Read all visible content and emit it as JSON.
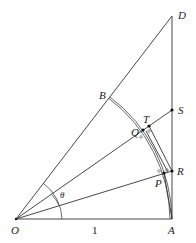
{
  "diagram": {
    "type": "geometry",
    "points": {
      "O": {
        "label": "O",
        "x": 16,
        "y": 219
      },
      "A": {
        "label": "A",
        "x": 172,
        "y": 219
      },
      "D": {
        "label": "D",
        "x": 172,
        "y": 16
      },
      "B": {
        "label": "B",
        "x": 110,
        "y": 97
      },
      "S": {
        "label": "S",
        "x": 172,
        "y": 110
      },
      "T": {
        "label": "T",
        "x": 149,
        "y": 126
      },
      "Q": {
        "label": "Q",
        "x": 143,
        "y": 130
      },
      "R": {
        "label": "R",
        "x": 172,
        "y": 171
      },
      "P": {
        "label": "P",
        "x": 164,
        "y": 173
      }
    },
    "angle_label": "θ",
    "side_label": "1",
    "colors": {
      "line": "#333333",
      "background": "#ffffff"
    }
  }
}
